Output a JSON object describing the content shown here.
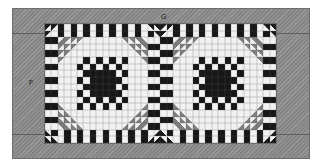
{
  "diagram": {
    "labels": [
      {
        "id": "F",
        "text": "F",
        "meaning": "side-border"
      },
      {
        "id": "G",
        "text": "G",
        "meaning": "top-border"
      }
    ],
    "colors": {
      "border": "#8d8d8d",
      "border_line": "#5e5e5e",
      "black": "#171717",
      "white": "#f2f2f2",
      "gray": "#7e7e7e",
      "dark_gray": "#4a4a4a",
      "light_gray": "#d8d8d8",
      "background": "#ffffff"
    },
    "quilt": {
      "columns": 36,
      "rows": 18,
      "block_size": 18,
      "blocks_across": 2,
      "blocks_down": 1,
      "cell_types": [
        "black",
        "white",
        "gray",
        "half-square-triangle"
      ]
    },
    "grid": [
      "wkwkwwTLGWkkTRGWwwkwwkwwTLGWkkTRGWwwkw",
      "kwkwwwTLGWkkTRGWwwwwkwTLGWkkTRGWwwwwkw",
      "wkwwkkkkTLGWwwTRGWkkwkwwkkkkTLGWwwTRGW",
      "kwwwkkkkwwTLGWTRGWkwwkwwkkkkwwTLGWTRGW",
      "gggwwwkkwwwwkkwwwwggggwwwwkkwwwwkkwwww",
      "ggggwwkkkkwwkkkkwwggggggwwkkkkwwkkkkww",
      "wwggggkkkkwwkkwwwwwwwwggggkkkkwwkkwwww",
      "wwwwggggkkwwwwwwkkwwwwwwwwggggkkwwwwww",
      "kkwwwwggggwwkkkkwwkkkkwwwwwwggggwwkkkk",
      "kkwwwwwwggggkkkkwwkkkkwwwwwwwwggggkkkk",
      "wwkkwwwwwwggggkkwwwwwwkkwwwwwwwwggggkk",
      "wwkkwwwwwwwwggggwwwwwwkkwwwwwwwwwwgggg",
      "kwwwkkkkwwTLGWTRGWkwwkwwkkkkwwTLGWTRGW",
      "wkwwkkkkTLGWwwTRGWkkwkwwkkkkTLGWwwTRGW",
      "kwkwwwTLGWkkTRGWwwwwkwTLGWkkTRGWwwwwkw",
      "wkwkwwTLGWkkTRGWwwkwwkwwTLGWkkTRGWwwkw",
      "kwkwwwkkwwwwkkwwwwkwkwwwkkwwwwkkwwwwkw",
      "wkwkwwwwkkkkwwkkwwwkwkwwwwkkkkwwkkwwwk"
    ]
  }
}
